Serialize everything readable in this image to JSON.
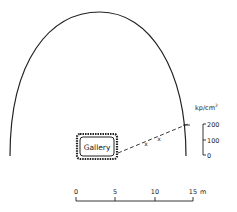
{
  "diagram": {
    "gallery_label": "Gallery",
    "stress_axis": {
      "unit_main": "kp/cm",
      "unit_sup": "2",
      "ticks": [
        "200",
        "100",
        "0"
      ]
    },
    "scale_bar": {
      "ticks": [
        "0",
        "5",
        "10",
        "15"
      ],
      "unit": "m"
    },
    "markers": [
      "x",
      "x"
    ]
  }
}
